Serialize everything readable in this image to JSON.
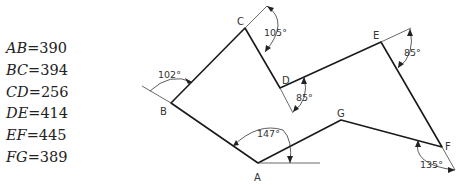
{
  "lengths": [
    {
      "name": "AB",
      "eq": "=",
      "value": "390"
    },
    {
      "name": "BC",
      "eq": "=",
      "value": "394"
    },
    {
      "name": "CD",
      "eq": "=",
      "value": "256"
    },
    {
      "name": "DE",
      "eq": "=",
      "value": "414"
    },
    {
      "name": "EF",
      "eq": "=",
      "value": "445"
    },
    {
      "name": "FG",
      "eq": "=",
      "value": "389"
    }
  ],
  "vertices": {
    "A": {
      "label": "A",
      "x": 258,
      "y": 163
    },
    "B": {
      "label": "B",
      "x": 171,
      "y": 103
    },
    "C": {
      "label": "C",
      "x": 245,
      "y": 28
    },
    "D": {
      "label": "D",
      "x": 280,
      "y": 88
    },
    "E": {
      "label": "E",
      "x": 381,
      "y": 42
    },
    "F": {
      "label": "F",
      "x": 442,
      "y": 147
    },
    "G": {
      "label": "G",
      "x": 341,
      "y": 120
    }
  },
  "angles": {
    "A": "147°",
    "B": "102°",
    "C": "105°",
    "D": "85°",
    "E": "85°",
    "F": "135°"
  }
}
